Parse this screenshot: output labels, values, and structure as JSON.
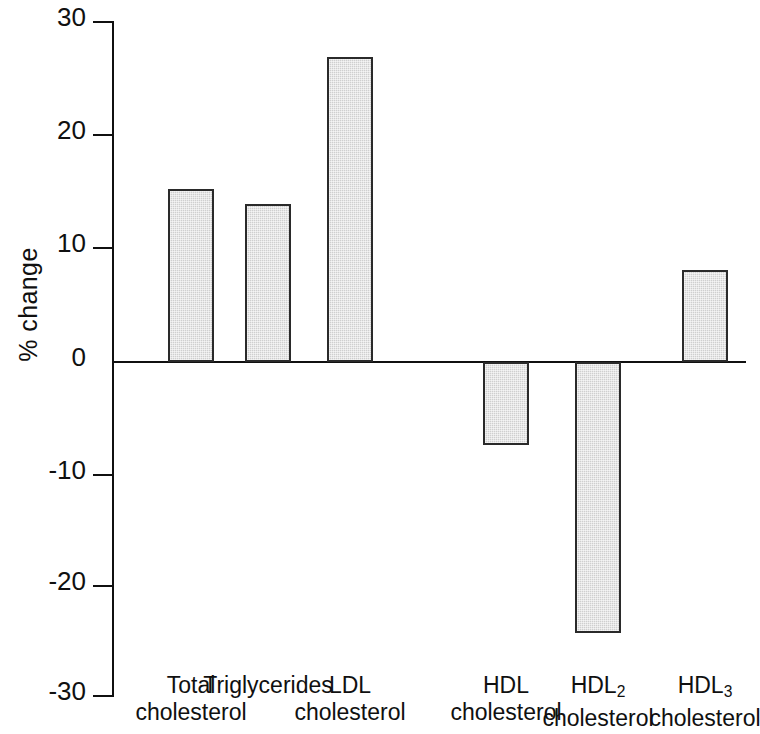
{
  "chart_data": {
    "type": "bar",
    "title": "",
    "subtitle": "",
    "xlabel": "",
    "ylabel": "% change",
    "ylim": [
      -30,
      30
    ],
    "ytick_labels": [
      "30",
      "20",
      "10",
      "0",
      "-10",
      "-20",
      "-30"
    ],
    "ytick_values": [
      30,
      20,
      10,
      0,
      -10,
      -20,
      -30
    ],
    "grid": false,
    "legend": "none",
    "bar_fill_color": "#cfcfcf",
    "bar_edge_color": "#2a2a2a",
    "axis_color": "#101010",
    "background_color": "#ffffff",
    "categories": [
      "Total cholesterol",
      "Triglycerides",
      "LDL cholesterol",
      "HDL cholesterol",
      "HDL2 cholesterol",
      "HDL3 cholesterol"
    ],
    "category_lines": [
      {
        "line1": "Total",
        "line2": "cholesterol",
        "sub": ""
      },
      {
        "line1": "Triglycerides",
        "line2": "",
        "sub": ""
      },
      {
        "line1": "LDL",
        "line2": "cholesterol",
        "sub": ""
      },
      {
        "line1": "HDL",
        "line2": "cholesterol",
        "sub": ""
      },
      {
        "line1": "HDL",
        "line2": "cholesterol",
        "sub": "2"
      },
      {
        "line1": "HDL",
        "line2": "cholesterol",
        "sub": "3"
      }
    ],
    "values": [
      15.2,
      13.9,
      26.8,
      -7.3,
      -23.8,
      8.1
    ]
  }
}
